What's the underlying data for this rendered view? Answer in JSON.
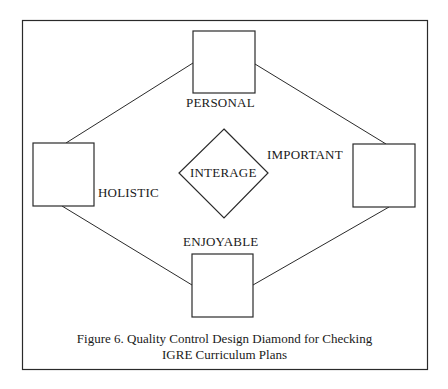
{
  "figure": {
    "type": "quality-control-diamond",
    "center": {
      "label": "INTERAGE"
    },
    "nodes": [
      {
        "id": "top",
        "label": "PERSONAL"
      },
      {
        "id": "left",
        "label": "HOLISTIC"
      },
      {
        "id": "right",
        "label": "IMPORTANT"
      },
      {
        "id": "bottom",
        "label": "ENJOYABLE"
      }
    ],
    "edges": [
      {
        "from": "top",
        "to": "left"
      },
      {
        "from": "top",
        "to": "right"
      },
      {
        "from": "left",
        "to": "bottom"
      },
      {
        "from": "right",
        "to": "bottom"
      }
    ],
    "caption": {
      "line1": "Figure 6.  Quality Control Design Diamond for Checking",
      "line2": "IGRE Curriculum Plans"
    },
    "colors": {
      "stroke": "#2a2a2a",
      "background": "#ffffff",
      "text": "#1a1a1a"
    }
  }
}
